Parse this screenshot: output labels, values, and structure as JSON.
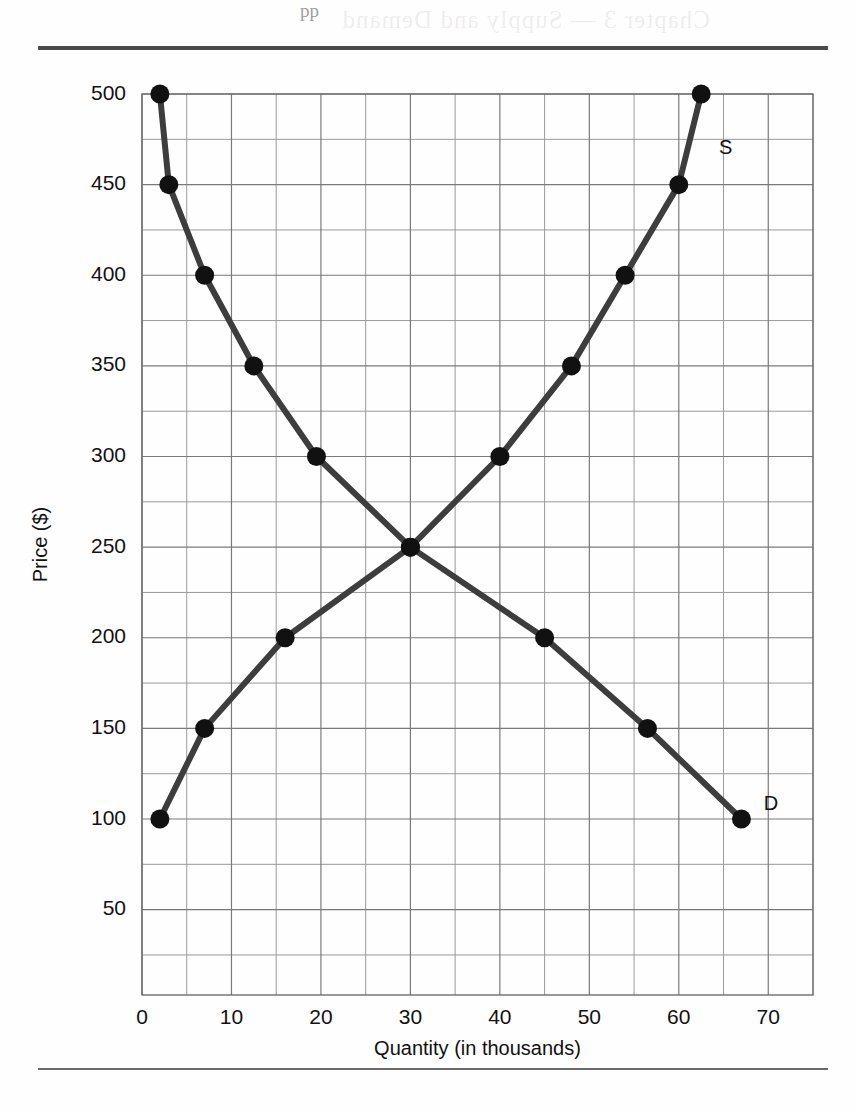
{
  "page": {
    "bleed_through_text": "Chapter 3 — Supply and Demand",
    "bleed_mark": "pp"
  },
  "chart_data": {
    "type": "line",
    "title": "",
    "xlabel": "Quantity (in thousands)",
    "ylabel": "Price ($)",
    "xlim": [
      0,
      75
    ],
    "ylim": [
      0,
      505
    ],
    "x_ticks": [
      0,
      10,
      20,
      30,
      40,
      50,
      60,
      70
    ],
    "x_tick_labels": [
      "0",
      "10",
      "20",
      "30",
      "40",
      "50",
      "60",
      "70"
    ],
    "x_minor_step": 5,
    "y_ticks": [
      50,
      100,
      150,
      200,
      250,
      300,
      350,
      400,
      450,
      500
    ],
    "y_tick_labels": [
      "50",
      "100",
      "150",
      "200",
      "250",
      "300",
      "350",
      "400",
      "450",
      "500"
    ],
    "y_minor_step": 25,
    "grid": true,
    "legend": "inline-curve-labels",
    "equilibrium": {
      "quantity": 30,
      "price": 250
    },
    "series": [
      {
        "name": "D",
        "label": "D",
        "label_position": {
          "x": 69.5,
          "y": 108
        },
        "description": "Demand curve",
        "color": "#3d3d3d",
        "points": [
          {
            "x": 2,
            "y": 500
          },
          {
            "x": 3,
            "y": 450
          },
          {
            "x": 7,
            "y": 400
          },
          {
            "x": 12.5,
            "y": 350
          },
          {
            "x": 19.5,
            "y": 300
          },
          {
            "x": 30,
            "y": 250
          },
          {
            "x": 45,
            "y": 200
          },
          {
            "x": 56.5,
            "y": 150
          },
          {
            "x": 67,
            "y": 100
          }
        ]
      },
      {
        "name": "S",
        "label": "S",
        "label_position": {
          "x": 64.5,
          "y": 470
        },
        "description": "Supply curve",
        "color": "#3d3d3d",
        "points": [
          {
            "x": 2,
            "y": 100
          },
          {
            "x": 7,
            "y": 150
          },
          {
            "x": 16,
            "y": 200
          },
          {
            "x": 30,
            "y": 250
          },
          {
            "x": 40,
            "y": 300
          },
          {
            "x": 48,
            "y": 350
          },
          {
            "x": 54,
            "y": 400
          },
          {
            "x": 60,
            "y": 450
          },
          {
            "x": 62.5,
            "y": 500
          }
        ]
      }
    ]
  }
}
